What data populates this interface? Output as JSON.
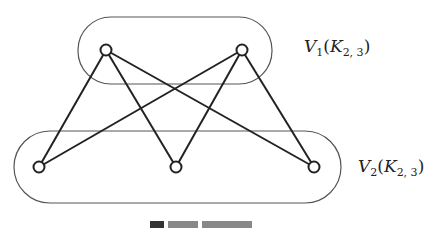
{
  "diagram": {
    "type": "bipartite-graph",
    "groups": [
      {
        "id": "V1",
        "label_main": "V",
        "label_sub": "1",
        "label_paren_open": "(",
        "label_K": "K",
        "label_K_sub": "2, 3",
        "label_paren_close": ")"
      },
      {
        "id": "V2",
        "label_main": "V",
        "label_sub": "2",
        "label_paren_open": "(",
        "label_K": "K",
        "label_K_sub": "2, 3",
        "label_paren_close": ")"
      }
    ],
    "nodes": [
      {
        "id": "a1",
        "group": "V1",
        "x": 106,
        "y": 50
      },
      {
        "id": "a2",
        "group": "V1",
        "x": 242,
        "y": 50
      },
      {
        "id": "b1",
        "group": "V2",
        "x": 39,
        "y": 167
      },
      {
        "id": "b2",
        "group": "V2",
        "x": 176,
        "y": 167
      },
      {
        "id": "b3",
        "group": "V2",
        "x": 314,
        "y": 167
      }
    ],
    "edges": [
      [
        "a1",
        "b1"
      ],
      [
        "a1",
        "b2"
      ],
      [
        "a1",
        "b3"
      ],
      [
        "a2",
        "b1"
      ],
      [
        "a2",
        "b2"
      ],
      [
        "a2",
        "b3"
      ]
    ],
    "colors": {
      "stroke": "#222222",
      "container": "#555555",
      "background": "#ffffff"
    }
  }
}
